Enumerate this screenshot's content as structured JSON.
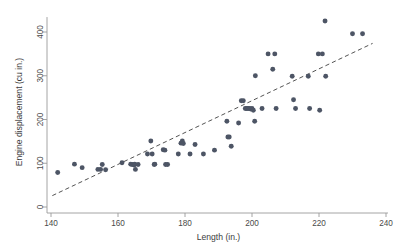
{
  "chart_data": {
    "type": "scatter",
    "title": "",
    "xlabel": "Length (in.)",
    "ylabel": "Engine displacement (cu in.)",
    "xlim": [
      140,
      240
    ],
    "ylim": [
      0,
      425
    ],
    "xticks": [
      140,
      160,
      180,
      200,
      220,
      240
    ],
    "yticks": [
      0,
      100,
      200,
      300,
      400
    ],
    "grid": false,
    "legend": null,
    "marker_color": "#4d5565",
    "fitline_color": "#4a4a4a",
    "fitline_style": "dashed",
    "fitline": {
      "x_start": 140.4,
      "y_start": 26,
      "x_end": 236,
      "y_end": 374
    },
    "series": [
      {
        "name": "Automobiles",
        "points": [
          [
            142.0,
            79
          ],
          [
            147.0,
            98
          ],
          [
            149.3,
            90
          ],
          [
            154.0,
            86
          ],
          [
            154.8,
            86
          ],
          [
            155.3,
            97
          ],
          [
            156.3,
            85
          ],
          [
            161.2,
            101
          ],
          [
            163.8,
            98
          ],
          [
            164.2,
            97
          ],
          [
            164.8,
            96
          ],
          [
            165.0,
            98
          ],
          [
            165.2,
            86
          ],
          [
            166.0,
            97
          ],
          [
            168.8,
            121
          ],
          [
            169.8,
            151
          ],
          [
            170.2,
            121
          ],
          [
            170.8,
            97
          ],
          [
            171.0,
            98
          ],
          [
            173.5,
            131
          ],
          [
            174.0,
            130
          ],
          [
            174.2,
            97
          ],
          [
            174.8,
            97
          ],
          [
            178.0,
            121
          ],
          [
            178.8,
            146
          ],
          [
            179.2,
            151
          ],
          [
            179.5,
            145
          ],
          [
            181.5,
            121
          ],
          [
            183.0,
            143
          ],
          [
            185.5,
            121
          ],
          [
            188.8,
            130
          ],
          [
            192.5,
            196
          ],
          [
            192.8,
            160
          ],
          [
            193.2,
            160
          ],
          [
            193.8,
            139
          ],
          [
            196.0,
            192
          ],
          [
            196.8,
            243
          ],
          [
            197.4,
            243
          ],
          [
            198.0,
            225
          ],
          [
            198.4,
            225
          ],
          [
            198.8,
            225
          ],
          [
            199.2,
            225
          ],
          [
            199.6,
            224
          ],
          [
            200.0,
            225
          ],
          [
            200.4,
            221
          ],
          [
            200.8,
            196
          ],
          [
            201.0,
            300
          ],
          [
            203.0,
            225
          ],
          [
            204.8,
            350
          ],
          [
            206.2,
            315
          ],
          [
            206.8,
            350
          ],
          [
            207.2,
            225
          ],
          [
            212.0,
            299
          ],
          [
            212.4,
            245
          ],
          [
            213.0,
            225
          ],
          [
            216.8,
            299
          ],
          [
            217.2,
            225
          ],
          [
            219.8,
            350
          ],
          [
            220.2,
            221
          ],
          [
            221.0,
            350
          ],
          [
            221.8,
            425
          ],
          [
            222.0,
            299
          ],
          [
            230.0,
            396
          ],
          [
            233.0,
            396
          ]
        ]
      }
    ]
  }
}
